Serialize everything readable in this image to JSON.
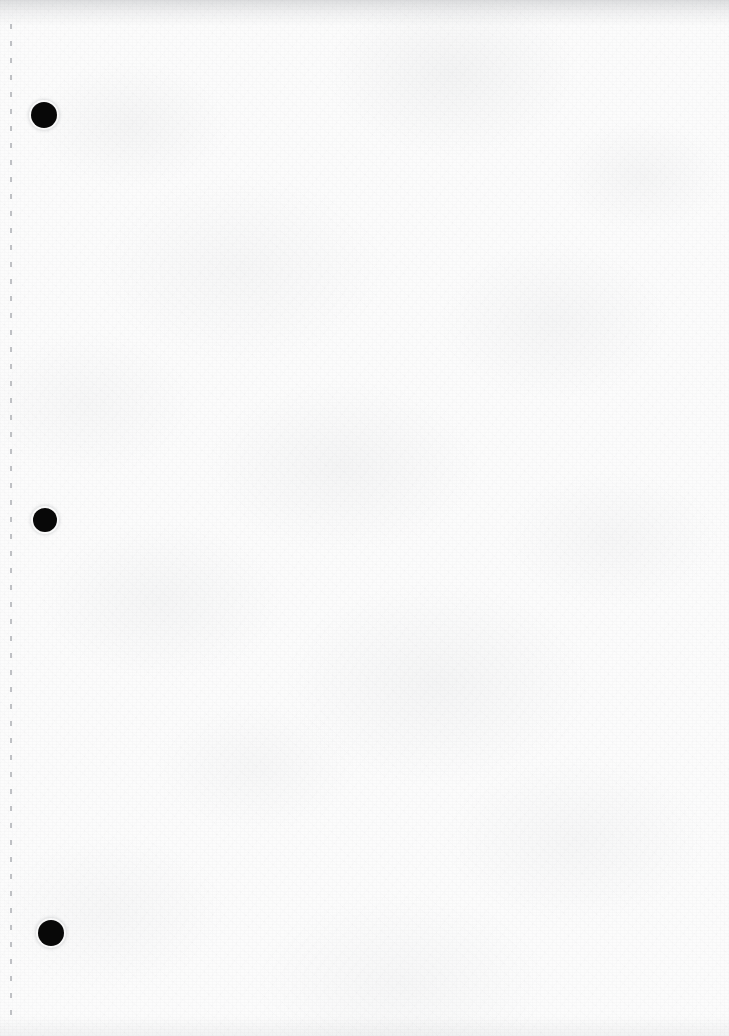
{
  "document": {
    "kind": "scanned-blank-page",
    "title": "Scanned Blank Page",
    "page_text": "",
    "width": 729,
    "height": 1036,
    "background_color": "#fcfcfc",
    "paper_tint": "#fdfdfd",
    "has_visible_text": false,
    "note": ""
  },
  "perforation_line": {
    "name": "left-margin-dashed-line",
    "color": "#b4b6ba",
    "x": 10,
    "top": 24,
    "bottom": 1024,
    "thickness": 1.5,
    "dash_length": 5,
    "dash_gap": 12
  },
  "punch_holes": [
    {
      "label": "top-hole",
      "cx": 44,
      "cy": 115,
      "r": 13,
      "color": "#080808"
    },
    {
      "label": "middle-hole",
      "cx": 45,
      "cy": 520,
      "r": 12,
      "color": "#080808"
    },
    {
      "label": "bottom-hole",
      "cx": 51,
      "cy": 933,
      "r": 13,
      "color": "#080808"
    }
  ],
  "edges": {
    "top_shadow_color": "#969ba0",
    "top_shadow_height": 26,
    "bottom_shadow_height": 20
  }
}
